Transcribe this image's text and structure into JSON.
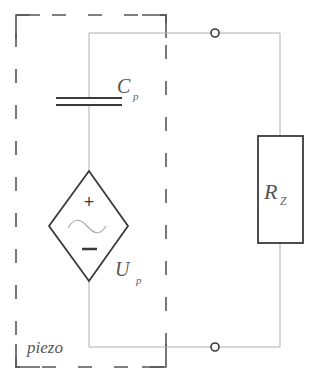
{
  "diagram": {
    "type": "circuit-schematic",
    "enclosure": {
      "label": "piezo",
      "style": "dashed"
    },
    "components": [
      {
        "id": "capacitor",
        "symbol": "C",
        "subscript": "p",
        "kind": "capacitor"
      },
      {
        "id": "source",
        "symbol": "U",
        "subscript": "p",
        "kind": "dependent-ac-voltage-source",
        "plus": "+",
        "minus": "−",
        "wave": "~"
      },
      {
        "id": "resistor",
        "symbol": "R",
        "subscript": "Z",
        "kind": "resistor"
      }
    ],
    "terminals": [
      {
        "id": "terminal-top"
      },
      {
        "id": "terminal-bottom"
      }
    ],
    "colors": {
      "wire": "#b0b0b0",
      "symbol": "#3a3a3a",
      "enclosure": "#555555",
      "background": "#ffffff"
    }
  }
}
